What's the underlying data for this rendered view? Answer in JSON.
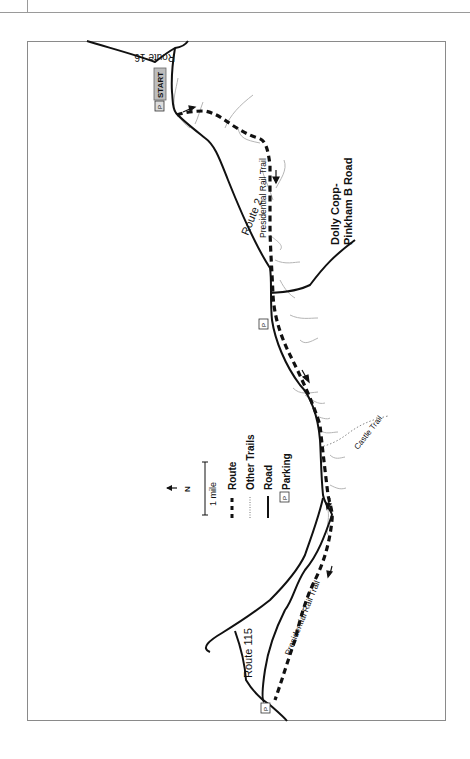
{
  "map": {
    "orientation": "rotated 90° (north points left)",
    "labels": {
      "route16": "Route 16",
      "start": "START",
      "parking_p": "P",
      "route2": "Route 2",
      "presidential_rail_trail_1": "Presidential Rail Trail",
      "dolly_copp_line1": "Dolly Copp-",
      "dolly_copp_line2": "Pinkham B Road",
      "castle_trail": "Castle Trail",
      "route115": "Route 115",
      "presidential_rail_trail_2": "Presidential Rail Trail"
    },
    "legend": {
      "north": "N",
      "scale": "1 mile",
      "items": [
        {
          "symbol": "dashed-thick",
          "label": "Route"
        },
        {
          "symbol": "dotted",
          "label": "Other Trails"
        },
        {
          "symbol": "solid",
          "label": "Road"
        },
        {
          "symbol": "parking-box",
          "label": "Parking"
        }
      ]
    },
    "colors": {
      "road": "#111111",
      "route": "#111111",
      "other_trails": "#999999",
      "streams": "#b0b0b0",
      "start_badge": "#bdbdbd",
      "frame": "#8a8a8a"
    }
  }
}
